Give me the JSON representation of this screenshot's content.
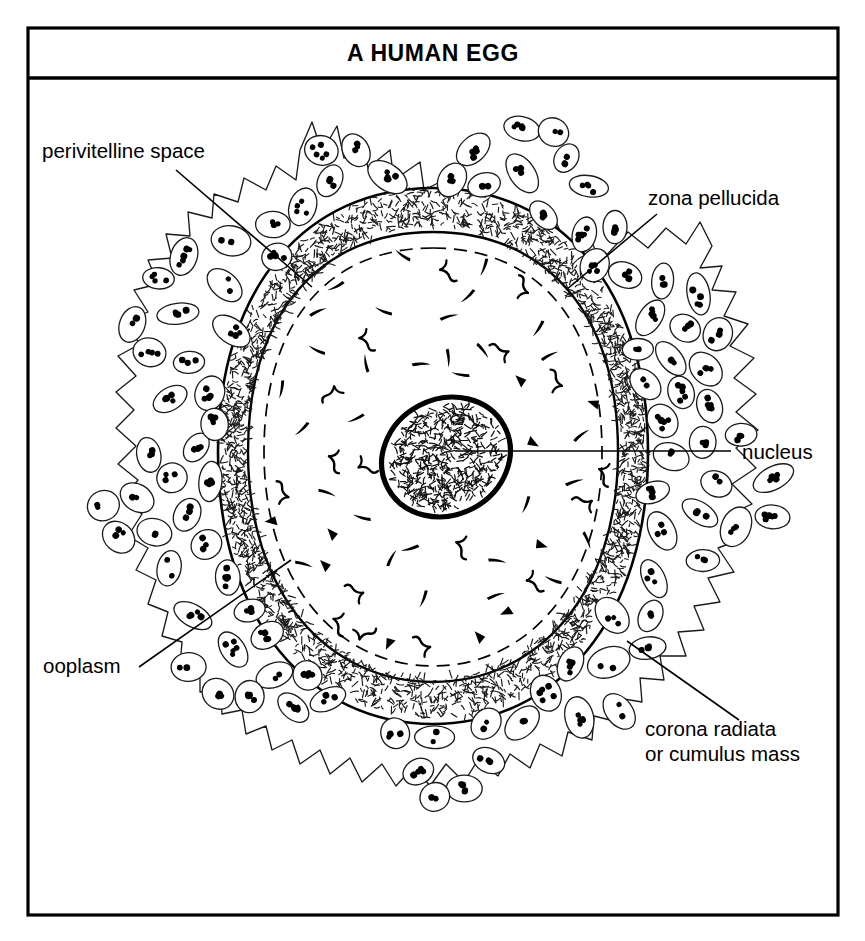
{
  "figure": {
    "title": "A HUMAN EGG",
    "border_color": "#000000",
    "background_color": "#ffffff",
    "ink_color": "#000000"
  },
  "labels": [
    {
      "id": "perivitelline-space",
      "text": "perivitelline space",
      "anchor": "start",
      "x": 42,
      "y": 158,
      "leader": {
        "x1": 176,
        "y1": 170,
        "x2": 312,
        "y2": 287
      }
    },
    {
      "id": "zona-pellucida",
      "text": "zona pellucida",
      "anchor": "start",
      "x": 648,
      "y": 205,
      "leader": {
        "x1": 657,
        "y1": 214,
        "x2": 566,
        "y2": 290
      }
    },
    {
      "id": "nucleus",
      "text": "nucleus",
      "anchor": "start",
      "x": 742,
      "y": 459,
      "leader": {
        "x1": 731,
        "y1": 451,
        "x2": 455,
        "y2": 451
      }
    },
    {
      "id": "ooplasm",
      "text": "ooplasm",
      "anchor": "start",
      "x": 43,
      "y": 673,
      "leader": {
        "x1": 139,
        "y1": 667,
        "x2": 291,
        "y2": 560
      }
    },
    {
      "id": "corona-radiata",
      "text": "corona radiata",
      "text_line2": "or cumulus mass",
      "anchor": "start",
      "x": 645,
      "y": 736,
      "y2": 761,
      "leader": {
        "x1": 627,
        "y1": 641,
        "x2": 739,
        "y2": 720
      }
    }
  ],
  "structures": {
    "corona_radiata": {
      "name": "corona radiata or cumulus mass",
      "description": "outer ragged layer of follicular cells, each an ellipse with dark nuclear dots"
    },
    "zona_pellucida": {
      "name": "zona pellucida",
      "description": "granular stippled band surrounding the oocyte"
    },
    "perivitelline_space": {
      "name": "perivitelline space",
      "description": "narrow gap between zona pellucida and ooplasm, shown as a dashed inner line"
    },
    "ooplasm": {
      "name": "ooplasm",
      "description": "cytoplasm of the egg containing scattered dark granules"
    },
    "nucleus": {
      "name": "nucleus",
      "description": "thick-outlined tilted oval filled with fine chromatin squiggles"
    }
  }
}
